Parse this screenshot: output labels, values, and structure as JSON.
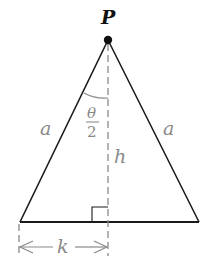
{
  "diagram": {
    "type": "isosceles-triangle",
    "colors": {
      "line": "#1a1a1a",
      "dashed": "#8a8a8a",
      "label": "#8a8a8a",
      "apex_label": "#111111",
      "background": "#ffffff"
    },
    "labels": {
      "apex": "P",
      "left_side": "a",
      "right_side": "a",
      "half_angle_numerator": "θ",
      "half_angle_denominator": "2",
      "height": "h",
      "half_base": "k"
    }
  }
}
